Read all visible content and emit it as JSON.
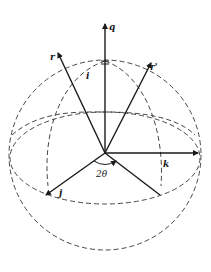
{
  "figure": {
    "type": "sphere-vector-diagram",
    "labels": {
      "q": "q",
      "r": "r",
      "r_prime": "r'",
      "i": "i",
      "j": "j",
      "k": "k",
      "angle": "2θ"
    },
    "colors": {
      "background": "#ffffff",
      "lines": "#1a1a1a",
      "dashed": "#333333"
    }
  }
}
